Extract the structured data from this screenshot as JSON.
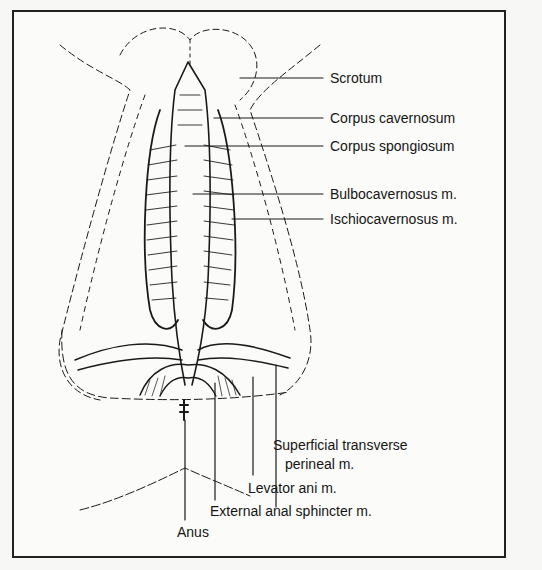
{
  "figure": {
    "labels": {
      "scrotum": "Scrotum",
      "corpus_cavernosum": "Corpus cavernosum",
      "corpus_spongiosum": "Corpus spongiosum",
      "bulbocavernosus": "Bulbocavernosus m.",
      "ischiocavernosus": "Ischiocavernosus m.",
      "superficial_transverse_1": "Superficial transverse",
      "superficial_transverse_2": "perineal m.",
      "levator_ani": "Levator ani m.",
      "external_anal_sphincter": "External anal sphincter m.",
      "anus": "Anus"
    },
    "colors": {
      "ink": "#1a1a1a",
      "paper": "#fbfbf9",
      "border": "#222222"
    }
  }
}
